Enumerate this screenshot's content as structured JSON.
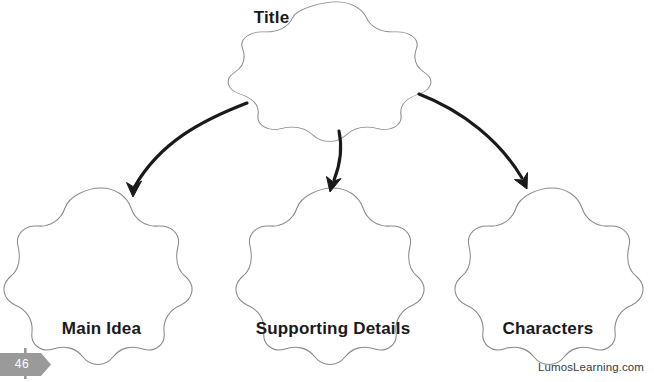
{
  "document": {
    "type": "graphic-organizer",
    "worksheet_title": "Story Map",
    "page_number": "46",
    "footer_brand": "LumosLearning.com"
  },
  "colors": {
    "background": "#ffffff",
    "shape_outline": "#8a8a8a",
    "arrow": "#1a1a1a",
    "label_text": "#1a1a1a",
    "badge_fill": "#9a9a9a",
    "badge_text": "#ffffff",
    "footer_text": "#3a3a3a"
  },
  "nodes": {
    "title": {
      "label": "Title",
      "shape": "five-petal-flower",
      "value": ""
    },
    "main_idea": {
      "label": "Main Idea",
      "shape": "five-petal-flower",
      "value": ""
    },
    "supporting_details": {
      "label": "Supporting Details",
      "shape": "five-petal-flower",
      "value": ""
    },
    "characters": {
      "label": "Characters",
      "shape": "five-petal-flower",
      "value": ""
    }
  },
  "connectors": [
    {
      "name": "title-to-main-idea",
      "from": "title",
      "to": "main_idea",
      "style": "curved-hand-drawn-arrow"
    },
    {
      "name": "title-to-supporting-details",
      "from": "title",
      "to": "supporting_details",
      "style": "curved-hand-drawn-arrow"
    },
    {
      "name": "title-to-characters",
      "from": "title",
      "to": "characters",
      "style": "curved-hand-drawn-arrow"
    }
  ]
}
